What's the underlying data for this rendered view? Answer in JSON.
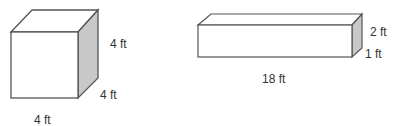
{
  "figures": [
    {
      "name": "cube",
      "labels": {
        "height": "4 ft",
        "depth": "4 ft",
        "width": "4 ft"
      }
    },
    {
      "name": "rectangular-prism",
      "labels": {
        "height": "2 ft",
        "depth": "1 ft",
        "length": "18 ft"
      }
    }
  ],
  "colors": {
    "stroke": "#555555",
    "side_shade": "#c8c8c8",
    "face": "#ffffff"
  }
}
